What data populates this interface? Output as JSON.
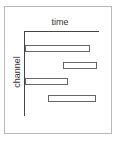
{
  "diagram": {
    "x_axis_label": "time",
    "y_axis_label": "channel",
    "colors": {
      "frame": "#b8b8b8",
      "axis": "#444444",
      "bar_border": "#666666",
      "bar_fill": "#ffffff"
    },
    "bars": [
      {
        "left": 25,
        "top": 45,
        "width": 63
      },
      {
        "left": 63,
        "top": 62,
        "width": 32
      },
      {
        "left": 25,
        "top": 78,
        "width": 41
      },
      {
        "left": 48,
        "top": 95,
        "width": 46
      }
    ]
  }
}
